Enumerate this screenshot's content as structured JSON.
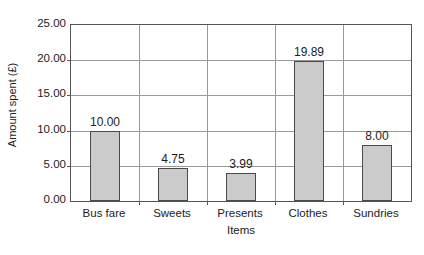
{
  "chart_data": {
    "type": "bar",
    "title": "",
    "categories": [
      "Bus fare",
      "Sweets",
      "Presents",
      "Clothes",
      "Sundries"
    ],
    "values": [
      10.0,
      4.75,
      3.99,
      19.89,
      8.0
    ],
    "value_labels": [
      "10.00",
      "4.75",
      "3.99",
      "19.89",
      "8.00"
    ],
    "xlabel": "Items",
    "ylabel": "Amount spent (£)",
    "ylim": [
      0,
      25
    ],
    "ytick_step": 5,
    "ytick_labels": [
      "0.00",
      "5.00",
      "10.00",
      "15.00",
      "20.00",
      "25.00"
    ],
    "ytick_values": [
      0,
      5,
      10,
      15,
      20,
      25
    ],
    "grid": true,
    "legend": false,
    "bar_fill_color": "#cbcbcb",
    "bar_border_color": "#4a4a4a",
    "gridline_color": "#9a9a9a",
    "axis_color": "#555555",
    "background_color": "#ffffff"
  }
}
